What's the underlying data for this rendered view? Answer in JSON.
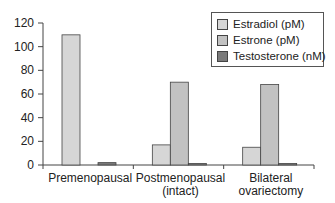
{
  "chart_data": {
    "type": "bar",
    "title": "",
    "xlabel": "",
    "ylabel": "",
    "ylim": [
      0,
      120
    ],
    "yticks": [
      0,
      20,
      40,
      60,
      80,
      100,
      120
    ],
    "grid": false,
    "legend_position": "top-right",
    "categories": [
      "Premenopausal",
      "Postmenopausal (intact)",
      "Bilateral ovariectomy"
    ],
    "category_lines": [
      [
        "Premenopausal"
      ],
      [
        "Postmenopausal",
        "(intact)"
      ],
      [
        "Bilateral",
        "ovariectomy"
      ]
    ],
    "series": [
      {
        "name": "Estradiol (pM)",
        "color": "#d6d6d6",
        "values": [
          110,
          17,
          15
        ]
      },
      {
        "name": "Estrone (pM)",
        "color": "#c2c2c2",
        "values": [
          0,
          70,
          68
        ]
      },
      {
        "name": "Testosterone (nM)",
        "color": "#7a7a7a",
        "values": [
          2,
          0.5,
          0.5
        ]
      }
    ]
  },
  "legend": {
    "items": [
      {
        "label": "Estradiol (pM)",
        "color": "#d6d6d6"
      },
      {
        "label": "Estrone (pM)",
        "color": "#c2c2c2"
      },
      {
        "label": "Testosterone (nM)",
        "color": "#7a7a7a"
      }
    ]
  }
}
